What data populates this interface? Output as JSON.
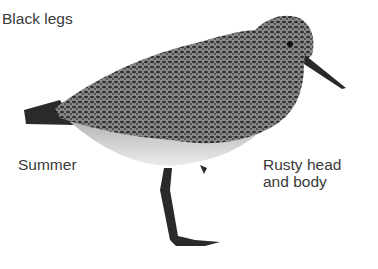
{
  "labels": {
    "black_legs": "Black legs",
    "summer": "Summer",
    "rusty_line1": "Rusty head",
    "rusty_line2": "and body"
  },
  "colors": {
    "text": "#3a3a3a",
    "dark": "#2a2a2a",
    "mid": "#6a6a6a",
    "light": "#d8d8d8"
  }
}
